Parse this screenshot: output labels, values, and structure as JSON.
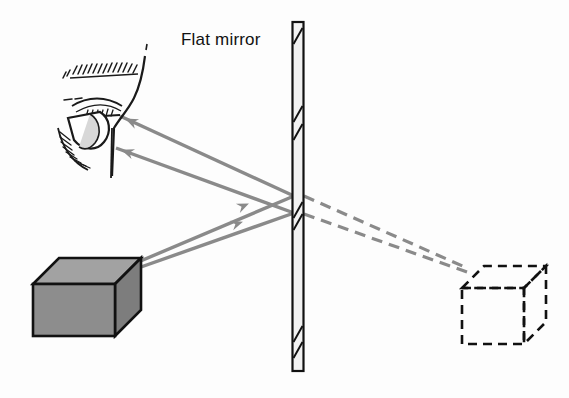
{
  "figure": {
    "background_color": "#fdfdfd",
    "labels": {
      "flat_mirror": "Flat mirror"
    }
  },
  "colors": {
    "ray": "#8a8a8a",
    "virtual_ray": "#8a8a8a",
    "object_fill_front": "#8d8d8d",
    "object_fill_top": "#a2a2a2",
    "object_fill_side": "#7d7d7d",
    "outline": "#111111",
    "mirror_fill": "#f2f2f2",
    "text": "#111111"
  },
  "elements": {
    "mirror": {
      "name": "Flat mirror",
      "orientation": "vertical",
      "x_center": 298,
      "top_y": 22,
      "bottom_y": 371,
      "width": 11,
      "hatch_marks_y": [
        34,
        110,
        128,
        205,
        213,
        330,
        344
      ]
    },
    "object_cube": {
      "name": "Object (real cube)",
      "style": "solid",
      "filled": true,
      "x": 33,
      "y": 258,
      "width": 82,
      "height": 78,
      "depth_offset": 26,
      "ray_origin": {
        "x": 122,
        "y": 267
      }
    },
    "image_cube": {
      "name": "Virtual image cube",
      "style": "dashed",
      "filled": false,
      "x": 472,
      "y": 275,
      "width": 72,
      "height": 70,
      "depth_offset": 22,
      "ray_target": {
        "x": 464,
        "y": 267
      }
    },
    "eye": {
      "name": "Observer eye",
      "x": 62,
      "y": 58,
      "width": 88,
      "height": 110,
      "pupil_x": 90,
      "pupil_y": 124
    }
  },
  "rays": [
    {
      "id": "incident-upper",
      "kind": "incident",
      "style": "solid",
      "description": "Ray from cube to mirror (upper reflection point)",
      "from": {
        "x": 124,
        "y": 268
      },
      "to": {
        "x": 293,
        "y": 196
      },
      "arrow_at": {
        "x": 244,
        "y": 206
      }
    },
    {
      "id": "incident-lower",
      "kind": "incident",
      "style": "solid",
      "description": "Ray from cube to mirror (lower reflection point)",
      "from": {
        "x": 124,
        "y": 272
      },
      "to": {
        "x": 293,
        "y": 213
      },
      "arrow_at": {
        "x": 238,
        "y": 223
      }
    },
    {
      "id": "reflected-upper",
      "kind": "reflected",
      "style": "solid",
      "description": "Reflected ray from mirror to eye (upper)",
      "from": {
        "x": 293,
        "y": 196
      },
      "to": {
        "x": 118,
        "y": 116
      },
      "arrow_at": {
        "x": 126,
        "y": 119
      }
    },
    {
      "id": "reflected-lower",
      "kind": "reflected",
      "style": "solid",
      "description": "Reflected ray from mirror to eye (lower)",
      "from": {
        "x": 293,
        "y": 213
      },
      "to": {
        "x": 114,
        "y": 148
      },
      "arrow_at": {
        "x": 122,
        "y": 151
      }
    },
    {
      "id": "virtual-upper",
      "kind": "virtual-extension",
      "style": "dashed",
      "description": "Dashed extension behind mirror to virtual image (upper)",
      "from": {
        "x": 303,
        "y": 196
      },
      "to": {
        "x": 466,
        "y": 268
      }
    },
    {
      "id": "virtual-lower",
      "kind": "virtual-extension",
      "style": "dashed",
      "description": "Dashed extension behind mirror to virtual image (lower)",
      "from": {
        "x": 303,
        "y": 214
      },
      "to": {
        "x": 466,
        "y": 272
      }
    }
  ]
}
